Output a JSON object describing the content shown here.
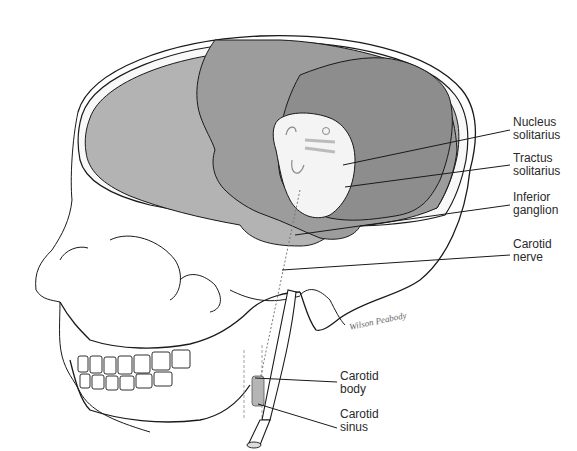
{
  "figure": {
    "signature": "Wilson Peabody",
    "colors": {
      "background": "#ffffff",
      "brain_dark": "#8d8d8d",
      "brain_mid": "#9c9c9c",
      "brain_light": "#b3b3b3",
      "brainstem": "#f4f4f4",
      "line": "#1a1a1a",
      "label_text": "#2a2a2a"
    }
  },
  "labels": [
    {
      "id": "nucleus-solitarius",
      "line1": "Nucleus",
      "line2": "solitarius"
    },
    {
      "id": "tractus-solitarius",
      "line1": "Tractus",
      "line2": "solitarius"
    },
    {
      "id": "inferior-ganglion",
      "line1": "Inferior",
      "line2": "ganglion"
    },
    {
      "id": "carotid-nerve",
      "line1": "Carotid",
      "line2": "nerve"
    },
    {
      "id": "carotid-body",
      "line1": "Carotid",
      "line2": "body"
    },
    {
      "id": "carotid-sinus",
      "line1": "Carotid",
      "line2": "sinus"
    }
  ]
}
